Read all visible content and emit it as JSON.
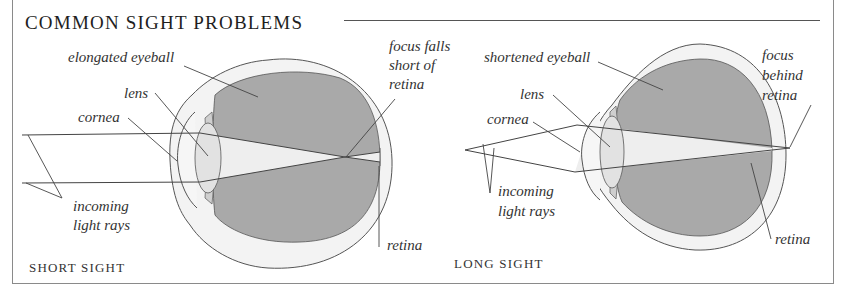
{
  "title": "COMMON SIGHT PROBLEMS",
  "colors": {
    "vitreous": "#a9a9a9",
    "sclera": "#f3f3f3",
    "lens": "#e2e2e2",
    "iris": "#cfcfcf",
    "line": "#444444",
    "light_cone": "#eeeeee"
  },
  "short_sight": {
    "caption": "SHORT SIGHT",
    "labels": {
      "eyeball": "elongated eyeball",
      "lens": "lens",
      "cornea": "cornea",
      "focus_line1": "focus falls",
      "focus_line2": "short of",
      "focus_line3": "retina",
      "rays_line1": "incoming",
      "rays_line2": "light rays",
      "retina": "retina"
    }
  },
  "long_sight": {
    "caption": "LONG SIGHT",
    "labels": {
      "eyeball": "shortened eyeball",
      "lens": "lens",
      "cornea": "cornea",
      "focus_line1": "focus",
      "focus_line2": "behind",
      "focus_line3": "retina",
      "rays_line1": "incoming",
      "rays_line2": "light rays",
      "retina": "retina"
    }
  }
}
